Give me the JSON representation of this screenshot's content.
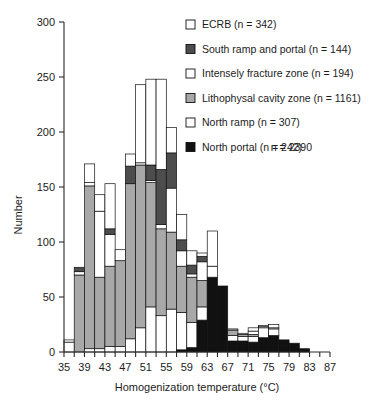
{
  "chart_data": {
    "type": "bar",
    "subtype": "stacked-histogram",
    "title": "",
    "xlabel": "Homogenization temperature (°C)",
    "ylabel": "Number",
    "xlim": [
      35,
      87
    ],
    "ylim": [
      0,
      300
    ],
    "ytick_step": 50,
    "xtick_step": 4,
    "xminor_step": 2,
    "grid": false,
    "legend_position": "top-right",
    "bin_width": 2,
    "xticks": [
      35,
      39,
      43,
      47,
      51,
      55,
      59,
      63,
      67,
      71,
      75,
      79,
      83,
      87
    ],
    "yticks": [
      0,
      50,
      100,
      150,
      200,
      250,
      300
    ],
    "bin_starts": [
      35,
      37,
      39,
      41,
      43,
      45,
      47,
      49,
      51,
      53,
      55,
      57,
      59,
      61,
      63,
      65,
      67,
      69,
      71,
      73,
      75,
      77,
      79,
      81,
      83
    ],
    "bin_labels": [
      "35-37",
      "37-39",
      "39-41",
      "41-43",
      "43-45",
      "45-47",
      "47-49",
      "49-51",
      "51-53",
      "53-55",
      "55-57",
      "57-59",
      "59-61",
      "61-63",
      "63-65",
      "65-67",
      "67-69",
      "69-71",
      "71-73",
      "73-75",
      "75-77",
      "77-79",
      "79-81",
      "81-83",
      "83-85"
    ],
    "series": [
      {
        "name": "North portal",
        "legend_label": "North portal (n = 242)",
        "n": 242,
        "color": "#111111",
        "swatch": "filled-black",
        "values": [
          0,
          0,
          0,
          0,
          0,
          0,
          0,
          0,
          0,
          0,
          0,
          2,
          4,
          29,
          68,
          60,
          10,
          10,
          9,
          13,
          15,
          11,
          8,
          3,
          0
        ]
      },
      {
        "name": "North ramp",
        "legend_label": "North ramp (n = 307)",
        "n": 307,
        "color": "#ffffff",
        "swatch": "open-white",
        "values": [
          9,
          0,
          3,
          3,
          5,
          5,
          12,
          22,
          41,
          33,
          39,
          34,
          23,
          12,
          0,
          0,
          5,
          4,
          5,
          9,
          6,
          0,
          0,
          0,
          0
        ]
      },
      {
        "name": "Lithophysal cavity zone",
        "legend_label": "Lithophysal cavity zone (n = 1161)",
        "n": 1161,
        "color": "#a8a8a8",
        "swatch": "filled-gray",
        "values": [
          0,
          70,
          148,
          65,
          73,
          78,
          141,
          148,
          113,
          79,
          70,
          42,
          41,
          24,
          0,
          0,
          5,
          2,
          2,
          0,
          0,
          0,
          0,
          0,
          0
        ]
      },
      {
        "name": "Intensely fracture zone",
        "legend_label": "Intensely fracture zone (n = 194)",
        "n": 194,
        "color": "#ffffff",
        "swatch": "open-white",
        "values": [
          0,
          3,
          3,
          60,
          29,
          0,
          0,
          2,
          2,
          4,
          40,
          14,
          3,
          17,
          10,
          0,
          1,
          1,
          3,
          1,
          1,
          0,
          0,
          0,
          0
        ]
      },
      {
        "name": "South ramp and portal",
        "legend_label": "South ramp and portal (n = 144)",
        "n": 144,
        "color": "#4d4d4d",
        "swatch": "filled-darkgray",
        "values": [
          0,
          4,
          0,
          0,
          5,
          0,
          16,
          0,
          14,
          50,
          32,
          10,
          8,
          5,
          0,
          0,
          0,
          0,
          0,
          0,
          0,
          0,
          0,
          0,
          0
        ]
      },
      {
        "name": "ECRB",
        "legend_label": "ECRB (n = 342)",
        "n": 342,
        "color": "#ffffff",
        "swatch": "open-white",
        "values": [
          2,
          0,
          17,
          15,
          41,
          10,
          11,
          71,
          78,
          82,
          23,
          23,
          13,
          3,
          32,
          0,
          0,
          0,
          3,
          1,
          3,
          0,
          0,
          0,
          0
        ]
      }
    ],
    "stack_order_bottom_to_top": [
      "North portal",
      "North ramp",
      "Lithophysal cavity zone",
      "Intensely fracture zone",
      "South ramp and portal",
      "ECRB"
    ],
    "total_label": "n =  2390",
    "total": 2390
  },
  "legend": {
    "items": [
      {
        "label": "ECRB (n = 342)",
        "swatch": "open-white"
      },
      {
        "label": "South ramp and portal (n = 144)",
        "swatch": "filled-darkgray"
      },
      {
        "label": "Intensely fracture zone (n = 194)",
        "swatch": "open-white"
      },
      {
        "label": "Lithophysal cavity zone (n = 1161)",
        "swatch": "filled-gray"
      },
      {
        "label": "North ramp (n = 307)",
        "swatch": "open-white"
      },
      {
        "label": "North portal (n = 242)",
        "swatch": "filled-black"
      }
    ],
    "total_text": "n =  2390"
  },
  "axes": {
    "y_title": "Number",
    "x_title": "Homogenization temperature (°C)",
    "y_tick_labels": [
      "300",
      "250",
      "200",
      "150",
      "100",
      "50",
      "0"
    ],
    "x_tick_labels": [
      "35",
      "39",
      "43",
      "47",
      "51",
      "55",
      "59",
      "63",
      "67",
      "71",
      "75",
      "79",
      "83",
      "87"
    ]
  },
  "colors": {
    "black": "#111111",
    "dark_gray": "#4d4d4d",
    "mid_gray": "#a8a8a8",
    "white": "#ffffff",
    "axis": "#2a2a2a",
    "background": "#ffffff"
  }
}
